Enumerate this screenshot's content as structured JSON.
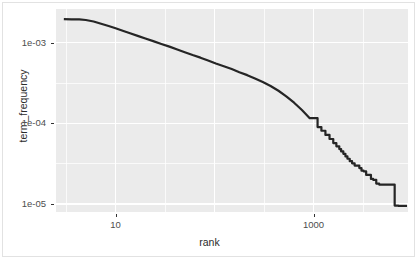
{
  "chart_data": {
    "type": "line",
    "title": "",
    "subtitle": "",
    "xlabel": "rank",
    "ylabel": "term_frequency",
    "xscale": "log10",
    "yscale": "log10",
    "xlim": [
      2.5,
      9000
    ],
    "ylim": [
      8e-06,
      0.0026
    ],
    "grid": true,
    "legend": null,
    "x_tick_labels": [
      "10",
      "1000"
    ],
    "x_tick_values": [
      10,
      1000
    ],
    "y_tick_labels": [
      "1e-03",
      "1e-04",
      "1e-05"
    ],
    "y_tick_values": [
      0.001,
      0.0001,
      1e-05
    ],
    "series": [
      {
        "name": "term_frequency_vs_rank",
        "color": "#252525",
        "line_width": 2.2,
        "x": [
          3,
          3.6,
          4.3,
          5,
          6,
          7,
          8.5,
          10,
          12,
          14,
          17,
          20,
          24,
          29,
          35,
          42,
          50,
          60,
          72,
          86,
          103,
          124,
          149,
          178,
          214,
          256,
          307,
          368,
          442,
          530,
          636,
          763,
          915,
          1098,
          1200,
          1318,
          1450,
          1582,
          1700,
          1820,
          1900,
          2000,
          2100,
          2200,
          2320,
          2450,
          2600,
          2750,
          2900,
          3050,
          3200,
          3400,
          3600,
          3800,
          4000,
          4300,
          4600,
          5000,
          5500,
          6000,
          6600,
          7200,
          8000,
          8800
        ],
        "y": [
          0.00195,
          0.00194,
          0.00193,
          0.0019,
          0.00182,
          0.00172,
          0.0016,
          0.0015,
          0.00139,
          0.0013,
          0.0012,
          0.00112,
          0.00104,
          0.00096,
          0.00089,
          0.00082,
          0.00076,
          0.0007,
          0.00065,
          0.0006,
          0.00055,
          0.00051,
          0.00047,
          0.00043,
          0.000395,
          0.00036,
          0.000325,
          0.00029,
          0.000253,
          0.000216,
          0.00018,
          0.000146,
          0.000116,
          9e-05,
          8.1e-05,
          7.2e-05,
          6.4e-05,
          5.7e-05,
          5.2e-05,
          4.8e-05,
          4.5e-05,
          4.2e-05,
          3.9e-05,
          3.65e-05,
          3.4e-05,
          3.2e-05,
          3e-05,
          3e-05,
          2.8e-05,
          2.6e-05,
          2.55e-05,
          2.3e-05,
          2.3e-05,
          2.05e-05,
          2e-05,
          1.8e-05,
          1.75e-05,
          1.75e-05,
          1.75e-05,
          1.75e-05,
          9.6e-06,
          9.5e-06,
          9.5e-06,
          9.5e-06
        ],
        "tail_style": "staircase"
      }
    ],
    "panel_background": "#ebebeb",
    "gridline_color": "#ffffff",
    "figure_background": "#ffffff",
    "tick_text_color": "#4d4d4d",
    "axis_title_color": "#2b2b2b"
  },
  "axes": {
    "x_title": "rank",
    "y_title": "term_frequency"
  },
  "ticks": {
    "x": [
      {
        "label": "10",
        "value": 10
      },
      {
        "label": "1000",
        "value": 1000
      }
    ],
    "y": [
      {
        "label": "1e-03",
        "value": 0.001
      },
      {
        "label": "1e-04",
        "value": 0.0001
      },
      {
        "label": "1e-05",
        "value": 1e-05
      }
    ]
  }
}
